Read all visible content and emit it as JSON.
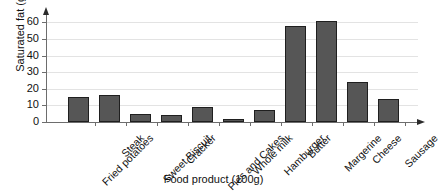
{
  "chart_data": {
    "type": "bar",
    "title": "",
    "xlabel": "Food product (100g)",
    "ylabel": "Saturated fat (g)",
    "categories": [
      "Fried potatoes",
      "Steak",
      "Sweet Biscuit",
      "Cracker",
      "Pies and Cakes",
      "Whole milk",
      "Hamburger",
      "Butter",
      "Margerine",
      "Cheese",
      "Sausage"
    ],
    "values": [
      15,
      16,
      5,
      4.5,
      9,
      2,
      7,
      58,
      61,
      24,
      14
    ],
    "ylim": [
      0,
      65
    ],
    "yticks": [
      0,
      10,
      20,
      30,
      40,
      50,
      60
    ],
    "ytick_labels": [
      "0",
      "10",
      "20",
      "30",
      "40",
      "50",
      "60"
    ],
    "grid": true,
    "legend": false,
    "bar_color": "#565656",
    "bar_edge_color": "#1f1f1f",
    "axis_color": "#6d6d6d",
    "grid_color": "#e3e3e3",
    "background": "#ffffff"
  }
}
